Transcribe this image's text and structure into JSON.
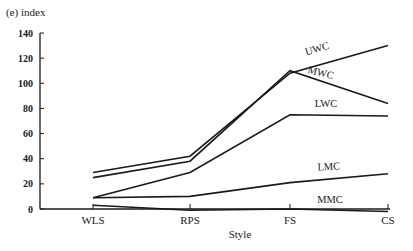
{
  "chart_data": {
    "type": "line",
    "title": "(e) index",
    "xlabel": "Style",
    "ylabel": "index",
    "categories": [
      "WLS",
      "RPS",
      "FS",
      "CS"
    ],
    "yticks": [
      0,
      20,
      40,
      60,
      80,
      100,
      120,
      140
    ],
    "ylim": [
      0,
      140
    ],
    "grid": false,
    "legend": "inline labels at right",
    "series": [
      {
        "name": "UWC",
        "values": [
          29,
          42,
          108,
          130
        ]
      },
      {
        "name": "MWC",
        "values": [
          25,
          38,
          110,
          84
        ]
      },
      {
        "name": "LWC",
        "values": [
          9,
          29,
          75,
          74
        ]
      },
      {
        "name": "LMC",
        "values": [
          9,
          10,
          21,
          28
        ]
      },
      {
        "name": "MMC",
        "values": [
          3,
          -1,
          0,
          -2
        ]
      }
    ]
  },
  "labels": {
    "title": "(e) index",
    "xlabel": "Style",
    "series": [
      "UWC",
      "MWC",
      "LWC",
      "LMC",
      "MMC"
    ]
  }
}
